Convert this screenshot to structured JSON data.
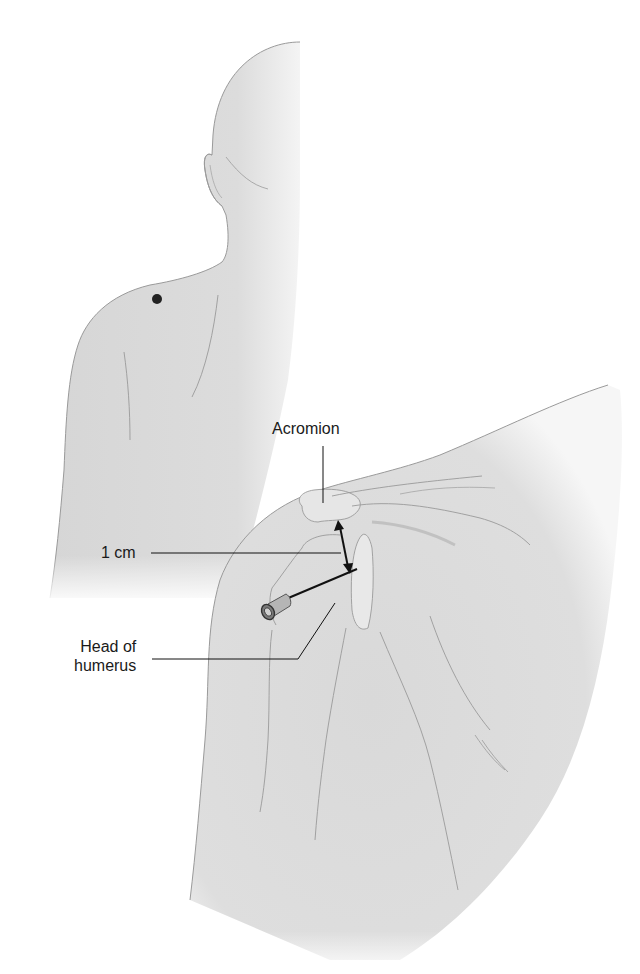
{
  "figure": {
    "panels": [
      {
        "name": "posterior-back-view",
        "marker": "injection-site-dot"
      },
      {
        "name": "shoulder-detail-view",
        "instrument": "needle-syringe"
      }
    ]
  },
  "labels": {
    "acromion": "Acromion",
    "distance": "1 cm",
    "head_of_humerus_line1": "Head of",
    "head_of_humerus_line2": "humerus"
  },
  "colors": {
    "background": "#ffffff",
    "skin_fill": "#dcdcdc",
    "skin_shade": "#c9c9c9",
    "outline": "#8e8e8e",
    "leader_line": "#1a1a1a",
    "marker_dot": "#222222",
    "needle": "#1a1a1a",
    "hub": "#6b6b6b"
  }
}
